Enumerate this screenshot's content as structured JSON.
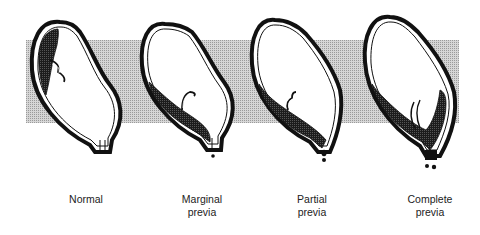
{
  "diagram": {
    "type": "illustration",
    "band_color": "#c8c8c8",
    "outline_color": "#111111",
    "placenta_color": "#2a2a2a",
    "panels": [
      {
        "id": "normal",
        "label_line1": "Normal",
        "label_line2": ""
      },
      {
        "id": "marginal",
        "label_line1": "Marginal",
        "label_line2": "previa"
      },
      {
        "id": "partial",
        "label_line1": "Partial",
        "label_line2": "previa"
      },
      {
        "id": "complete",
        "label_line1": "Complete",
        "label_line2": "previa"
      }
    ]
  }
}
